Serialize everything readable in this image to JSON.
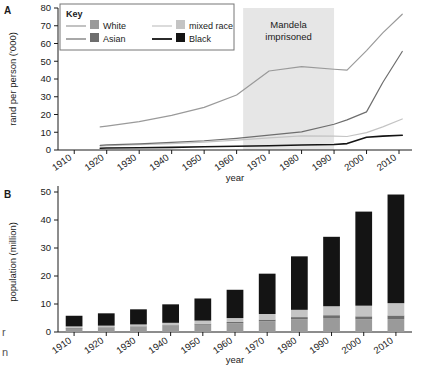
{
  "figure": {
    "panel_a_letter": "A",
    "panel_b_letter": "B",
    "edge_fragment_1": "r",
    "edge_fragment_2": "n"
  },
  "key": {
    "title": "Key",
    "entries": [
      {
        "label": "White",
        "color": "#9a9a9a"
      },
      {
        "label": "mixed race",
        "color": "#c4c4c4"
      },
      {
        "label": "Asian",
        "color": "#6e6e6e"
      },
      {
        "label": "Black",
        "color": "#141414"
      }
    ]
  },
  "annotations": {
    "mandela": {
      "line1": "Mandela",
      "line2": "imprisoned",
      "start_year": 1962,
      "end_year": 1990,
      "fill": "#e6e6e6"
    }
  },
  "chart_data": [
    {
      "id": "panel-a",
      "type": "line",
      "title": "",
      "xlabel": "year",
      "ylabel": "rand per person ('000)",
      "xlim": [
        1905,
        2014
      ],
      "ylim": [
        0,
        80
      ],
      "yticks": [
        0,
        10,
        20,
        30,
        40,
        50,
        60,
        70,
        80
      ],
      "xticks": [
        1910,
        1920,
        1930,
        1940,
        1950,
        1960,
        1970,
        1980,
        1990,
        2000,
        2010
      ],
      "grid": false,
      "legend": "inside-top-left",
      "x": [
        1918,
        1920,
        1930,
        1940,
        1950,
        1960,
        1970,
        1980,
        1990,
        1994,
        2000,
        2005,
        2011
      ],
      "series": [
        {
          "name": "White",
          "color": "#9a9a9a",
          "values": [
            13,
            13.5,
            16,
            19.5,
            24,
            31,
            44.5,
            47,
            45.5,
            45,
            56,
            66,
            76.5
          ]
        },
        {
          "name": "mixed race",
          "color": "#c4c4c4",
          "values": [
            2.2,
            2.4,
            3.0,
            3.6,
            4.4,
            5.6,
            6.8,
            8.0,
            7.8,
            7.6,
            9.8,
            13.0,
            17.5
          ]
        },
        {
          "name": "Asian",
          "color": "#6e6e6e",
          "values": [
            2.6,
            2.9,
            3.5,
            4.3,
            5.2,
            6.6,
            8.4,
            10.2,
            14.5,
            17.0,
            21.5,
            38.0,
            55.5
          ]
        },
        {
          "name": "Black",
          "color": "#141414",
          "values": [
            1.0,
            1.1,
            1.3,
            1.5,
            1.8,
            2.1,
            2.4,
            2.8,
            3.1,
            3.6,
            7.2,
            7.8,
            8.3
          ]
        }
      ]
    },
    {
      "id": "panel-b",
      "type": "bar",
      "stacked": true,
      "title": "",
      "xlabel": "year",
      "ylabel": "population (million)",
      "ylim": [
        0,
        50
      ],
      "yticks": [
        0,
        10,
        20,
        30,
        40,
        50
      ],
      "categories": [
        "1910",
        "1920",
        "1930",
        "1940",
        "1950",
        "1960",
        "1970",
        "1980",
        "1990",
        "2000",
        "2010"
      ],
      "grid": false,
      "series": [
        {
          "name": "White",
          "color": "#9a9a9a",
          "values": [
            1.3,
            1.5,
            1.8,
            2.2,
            2.6,
            3.1,
            3.8,
            4.5,
            5.0,
            4.5,
            4.6
          ]
        },
        {
          "name": "Asian",
          "color": "#6e6e6e",
          "values": [
            0.15,
            0.17,
            0.2,
            0.23,
            0.37,
            0.48,
            0.63,
            0.82,
            1.0,
            1.1,
            1.3
          ]
        },
        {
          "name": "mixed race",
          "color": "#c4c4c4",
          "values": [
            0.55,
            0.6,
            0.7,
            0.85,
            1.1,
            1.4,
            2.0,
            2.6,
            3.2,
            3.8,
            4.4
          ]
        },
        {
          "name": "Black",
          "color": "#141414",
          "values": [
            3.8,
            4.4,
            5.4,
            6.6,
            7.9,
            10.1,
            14.4,
            19.1,
            24.8,
            33.6,
            38.8
          ]
        }
      ],
      "totals": [
        5.8,
        6.7,
        8.1,
        9.9,
        11.9,
        15.1,
        20.8,
        27.0,
        34.0,
        43.0,
        49.1
      ]
    }
  ]
}
